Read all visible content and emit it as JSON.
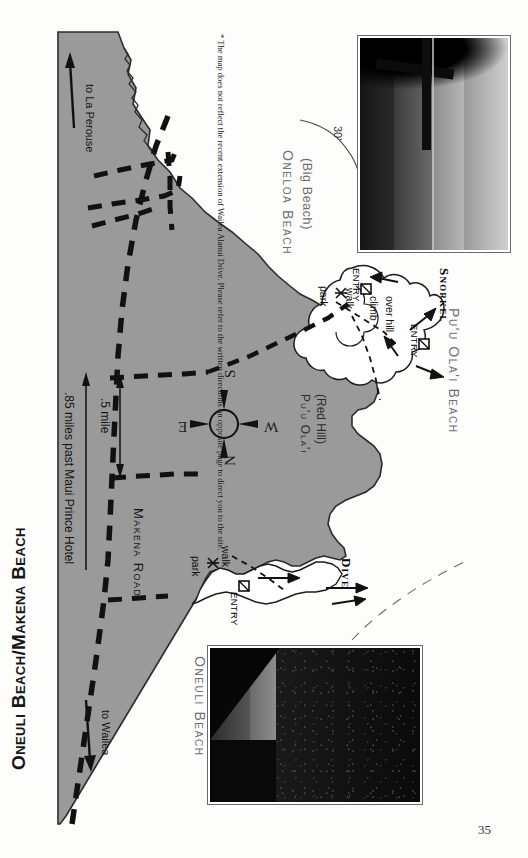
{
  "page": {
    "title": "Oneuli Beach/Makena Beach",
    "page_number": "35",
    "background_color": "#fdfdfb",
    "land_color": "#9a9a9a"
  },
  "note": {
    "text": "* The map does not reflect the recent extension of Wailea Alanui Drive. Please refer to the written directions on opposite page to direct you to the site."
  },
  "places": [
    {
      "name": "Oneloa Beach",
      "subtitle": "(Big Beach)"
    },
    {
      "name": "Oneuli Beach",
      "subtitle": ""
    },
    {
      "name": "Pu'u Ola'i Beach",
      "subtitle": ""
    }
  ],
  "landmarks": [
    {
      "name": "Pu'u Ola'i",
      "subtitle": "(Red Hill)"
    }
  ],
  "roads": [
    {
      "label": "Makena Road"
    },
    {
      "label": ".85 miles past Maui Prince Hotel"
    },
    {
      "label": ".5 mile"
    }
  ],
  "directions": [
    {
      "label": "to La Perouse"
    },
    {
      "label": "to Wailea"
    }
  ],
  "access_markers": [
    {
      "label": "park"
    },
    {
      "label": "walk"
    },
    {
      "label": "ENTRY"
    },
    {
      "label": "park"
    },
    {
      "label": "walk"
    },
    {
      "label": "climb"
    },
    {
      "label": "over hill"
    },
    {
      "label": "ENTRY"
    },
    {
      "label": "ENTRY"
    }
  ],
  "activities": [
    {
      "label": "Dive"
    },
    {
      "label": "Snorkel"
    }
  ],
  "depth_contours": [
    {
      "label": "30'"
    }
  ],
  "compass": {
    "north": "N",
    "south": "S",
    "east": "E",
    "west": "W"
  },
  "photos": [
    {
      "caption": "",
      "position": "top-right"
    },
    {
      "caption": "",
      "position": "bottom-center"
    }
  ]
}
